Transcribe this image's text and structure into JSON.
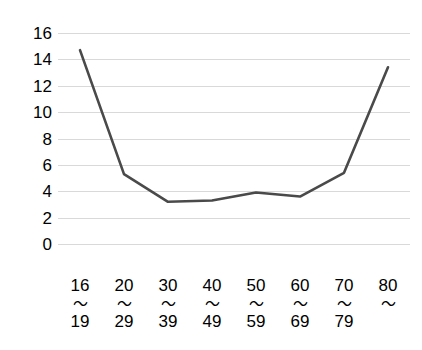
{
  "chart_data": {
    "type": "line",
    "title": "",
    "subtitle": "",
    "xlabel": "",
    "ylabel": "",
    "categories": [
      "16〜19",
      "20〜29",
      "30〜39",
      "40〜49",
      "50〜59",
      "60〜69",
      "70〜79",
      "80〜"
    ],
    "category_lines": [
      {
        "top": "16",
        "wave": "〜",
        "bottom": "19"
      },
      {
        "top": "20",
        "wave": "〜",
        "bottom": "29"
      },
      {
        "top": "30",
        "wave": "〜",
        "bottom": "39"
      },
      {
        "top": "40",
        "wave": "〜",
        "bottom": "49"
      },
      {
        "top": "50",
        "wave": "〜",
        "bottom": "59"
      },
      {
        "top": "60",
        "wave": "〜",
        "bottom": "69"
      },
      {
        "top": "70",
        "wave": "〜",
        "bottom": "79"
      },
      {
        "top": "80",
        "wave": "〜",
        "bottom": ""
      }
    ],
    "values": [
      14.7,
      5.3,
      3.2,
      3.3,
      3.9,
      3.6,
      5.4,
      13.4
    ],
    "ylim": [
      0,
      16
    ],
    "ytick_step": 2,
    "yticks": [
      16,
      14,
      12,
      10,
      8,
      6,
      4,
      2,
      0
    ],
    "grid": true,
    "grid_axis": "y",
    "legend": false,
    "legend_position": "none",
    "markers": false,
    "colors": {
      "line": "#4a4a4a",
      "grid": "#d9d9d9",
      "text": "#000000",
      "background": "#ffffff"
    }
  }
}
